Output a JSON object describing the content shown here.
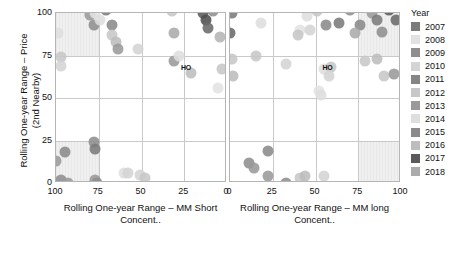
{
  "chart_data": {
    "type": "scatter",
    "title": "",
    "ylabel": "Rolling One-year Range – Price\n(2nd Nearby)",
    "yticks": [
      0,
      25,
      50,
      75,
      100
    ],
    "ylim": [
      0,
      100
    ],
    "grid": true,
    "legend": {
      "title": "Year",
      "position": "right",
      "entries": [
        {
          "label": "2007",
          "color": "#7b7b7b"
        },
        {
          "label": "2008",
          "color": "#e2e2e2"
        },
        {
          "label": "2009",
          "color": "#8e8e8e"
        },
        {
          "label": "2010",
          "color": "#d4d4d4"
        },
        {
          "label": "2011",
          "color": "#858585"
        },
        {
          "label": "2012",
          "color": "#c7c7c7"
        },
        {
          "label": "2013",
          "color": "#9a9a9a"
        },
        {
          "label": "2014",
          "color": "#dedede"
        },
        {
          "label": "2015",
          "color": "#8a8a8a"
        },
        {
          "label": "2016",
          "color": "#bdbdbd"
        },
        {
          "label": "2017",
          "color": "#5a5a5a"
        },
        {
          "label": "2018",
          "color": "#ababab"
        }
      ]
    },
    "panels": [
      {
        "name": "mm-short",
        "xlabel": "Rolling One-year Range – MM Short\nConcent..",
        "xticks": [
          100,
          75,
          50,
          25,
          0
        ],
        "xlim": [
          100,
          0
        ],
        "reversed": true,
        "shaded_regions": [
          {
            "x0": 100,
            "x1": 75,
            "y0": 75,
            "y1": 100
          },
          {
            "x0": 100,
            "x1": 75,
            "y0": 0,
            "y1": 25
          }
        ],
        "annotations": [
          {
            "text": "HO",
            "x": 24,
            "y": 68
          }
        ],
        "points": [
          {
            "x": 99,
            "y": 88,
            "c": "#dedede"
          },
          {
            "x": 97,
            "y": 74,
            "c": "#c7c7c7"
          },
          {
            "x": 97,
            "y": 69,
            "c": "#d4d4d4"
          },
          {
            "x": 80,
            "y": 99,
            "c": "#9a9a9a"
          },
          {
            "x": 77,
            "y": 100,
            "c": "#e2e2e2"
          },
          {
            "x": 78,
            "y": 93,
            "c": "#8e8e8e"
          },
          {
            "x": 74,
            "y": 96,
            "c": "#dedede"
          },
          {
            "x": 71,
            "y": 102,
            "c": "#7b7b7b"
          },
          {
            "x": 67,
            "y": 93,
            "c": "#8a8a8a"
          },
          {
            "x": 67,
            "y": 87,
            "c": "#c7c7c7"
          },
          {
            "x": 65,
            "y": 83,
            "c": "#bdbdbd"
          },
          {
            "x": 64,
            "y": 79,
            "c": "#9a9a9a"
          },
          {
            "x": 52,
            "y": 79,
            "c": "#d4d4d4"
          },
          {
            "x": 32,
            "y": 101,
            "c": "#c7c7c7"
          },
          {
            "x": 31,
            "y": 88,
            "c": "#ababab"
          },
          {
            "x": 31,
            "y": 72,
            "c": "#9a9a9a"
          },
          {
            "x": 28,
            "y": 75,
            "c": "#dedede"
          },
          {
            "x": 21,
            "y": 65,
            "c": "#bdbdbd"
          },
          {
            "x": 14,
            "y": 100,
            "c": "#5a5a5a"
          },
          {
            "x": 12,
            "y": 96,
            "c": "#4f4f4f"
          },
          {
            "x": 11,
            "y": 91,
            "c": "#6a6a6a"
          },
          {
            "x": 8,
            "y": 101,
            "c": "#8e8e8e"
          },
          {
            "x": 4,
            "y": 86,
            "c": "#b5b5b5"
          },
          {
            "x": 3,
            "y": 67,
            "c": "#c7c7c7"
          },
          {
            "x": 5,
            "y": 56,
            "c": "#e2e2e2"
          },
          {
            "x": 100,
            "y": 13,
            "c": "#9a9a9a"
          },
          {
            "x": 95,
            "y": 18,
            "c": "#8a8a8a"
          },
          {
            "x": 101,
            "y": 1,
            "c": "#dedede"
          },
          {
            "x": 97,
            "y": 2,
            "c": "#8e8e8e"
          },
          {
            "x": 93,
            "y": 0,
            "c": "#9a9a9a"
          },
          {
            "x": 78,
            "y": 24,
            "c": "#8e8e8e"
          },
          {
            "x": 77,
            "y": 20,
            "c": "#7b7b7b"
          },
          {
            "x": 77,
            "y": 2,
            "c": "#9a9a9a"
          },
          {
            "x": 76,
            "y": 0,
            "c": "#8e8e8e"
          },
          {
            "x": 60,
            "y": 6,
            "c": "#dedede"
          },
          {
            "x": 58,
            "y": 6,
            "c": "#d4d4d4"
          },
          {
            "x": 51,
            "y": 5,
            "c": "#d4d4d4"
          },
          {
            "x": 48,
            "y": 3,
            "c": "#c7c7c7"
          }
        ]
      },
      {
        "name": "mm-long",
        "xlabel": "Rolling One-year Range – MM long\nConcent..",
        "xticks": [
          0,
          25,
          50,
          75,
          100
        ],
        "xlim": [
          0,
          100
        ],
        "reversed": false,
        "shaded_regions": [
          {
            "x0": 75,
            "x1": 100,
            "y0": 75,
            "y1": 100
          },
          {
            "x0": 75,
            "x1": 100,
            "y0": 0,
            "y1": 25
          }
        ],
        "annotations": [
          {
            "text": "HO",
            "x": 57,
            "y": 68
          }
        ],
        "points": [
          {
            "x": 1,
            "y": 100,
            "c": "#7b7b7b"
          },
          {
            "x": 0,
            "y": 88,
            "c": "#6a6a6a"
          },
          {
            "x": 1,
            "y": 73,
            "c": "#c7c7c7"
          },
          {
            "x": 2,
            "y": 63,
            "c": "#bdbdbd"
          },
          {
            "x": 18,
            "y": 94,
            "c": "#dedede"
          },
          {
            "x": 15,
            "y": 75,
            "c": "#c7c7c7"
          },
          {
            "x": 33,
            "y": 70,
            "c": "#d4d4d4"
          },
          {
            "x": 45,
            "y": 98,
            "c": "#dedede"
          },
          {
            "x": 41,
            "y": 90,
            "c": "#e2e2e2"
          },
          {
            "x": 40,
            "y": 87,
            "c": "#c7c7c7"
          },
          {
            "x": 47,
            "y": 90,
            "c": "#d4d4d4"
          },
          {
            "x": 51,
            "y": 101,
            "c": "#c7c7c7"
          },
          {
            "x": 56,
            "y": 93,
            "c": "#8a8a8a"
          },
          {
            "x": 64,
            "y": 94,
            "c": "#7b7b7b"
          },
          {
            "x": 55,
            "y": 67,
            "c": "#dedede"
          },
          {
            "x": 59,
            "y": 68,
            "c": "#c7c7c7"
          },
          {
            "x": 58,
            "y": 63,
            "c": "#d4d4d4"
          },
          {
            "x": 52,
            "y": 54,
            "c": "#e2e2e2"
          },
          {
            "x": 53,
            "y": 52,
            "c": "#dedede"
          },
          {
            "x": 70,
            "y": 102,
            "c": "#8e8e8e"
          },
          {
            "x": 76,
            "y": 93,
            "c": "#8a8a8a"
          },
          {
            "x": 73,
            "y": 88,
            "c": "#ababab"
          },
          {
            "x": 83,
            "y": 100,
            "c": "#9a9a9a"
          },
          {
            "x": 86,
            "y": 96,
            "c": "#7b7b7b"
          },
          {
            "x": 89,
            "y": 89,
            "c": "#8e8e8e"
          },
          {
            "x": 93,
            "y": 102,
            "c": "#5a5a5a"
          },
          {
            "x": 97,
            "y": 96,
            "c": "#6a6a6a"
          },
          {
            "x": 79,
            "y": 72,
            "c": "#c7c7c7"
          },
          {
            "x": 86,
            "y": 73,
            "c": "#bdbdbd"
          },
          {
            "x": 90,
            "y": 63,
            "c": "#c7c7c7"
          },
          {
            "x": 96,
            "y": 64,
            "c": "#9a9a9a"
          },
          {
            "x": 11,
            "y": 12,
            "c": "#8e8e8e"
          },
          {
            "x": 14,
            "y": 9,
            "c": "#9a9a9a"
          },
          {
            "x": 22,
            "y": 19,
            "c": "#8a8a8a"
          },
          {
            "x": 22,
            "y": 4,
            "c": "#9a9a9a"
          },
          {
            "x": 33,
            "y": 0,
            "c": "#8e8e8e"
          },
          {
            "x": 41,
            "y": 3,
            "c": "#c7c7c7"
          },
          {
            "x": 44,
            "y": 4,
            "c": "#bdbdbd"
          },
          {
            "x": 55,
            "y": 4,
            "c": "#d4d4d4"
          }
        ]
      }
    ]
  }
}
